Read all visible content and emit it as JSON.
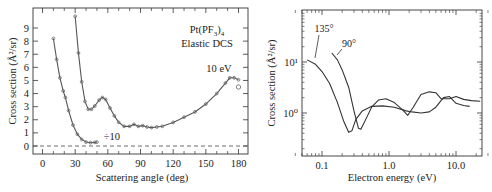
{
  "chart_data": [
    {
      "type": "line",
      "title": "Pt(PF3)4 Elastic DCS",
      "annotation_energy": "10 eV",
      "annotation_scale": "÷10",
      "xlabel": "Scattering angle (deg)",
      "ylabel": "Cross section (Å²/sr)",
      "xlim": [
        -8,
        185
      ],
      "ylim": [
        -0.5,
        10
      ],
      "xticks": [
        "0",
        "30",
        "60",
        "90",
        "120",
        "150",
        "180"
      ],
      "yticks": [
        "0",
        "1",
        "2",
        "3",
        "4",
        "5",
        "6",
        "7",
        "8",
        "9"
      ],
      "zero_line": "dashed",
      "series": [
        {
          "name": "÷10 (scaled)",
          "x": [
            10,
            13,
            16,
            19,
            21,
            24,
            28,
            32,
            36,
            40,
            44,
            48,
            50
          ],
          "y": [
            8.2,
            6.6,
            5.2,
            4.2,
            3.7,
            2.7,
            1.6,
            0.9,
            0.5,
            0.3,
            0.25,
            0.28,
            0.3
          ]
        },
        {
          "name": "10 eV",
          "x": [
            30,
            33,
            36,
            39,
            42,
            45,
            48,
            52,
            55,
            58,
            62,
            66,
            70,
            75,
            80,
            84,
            88,
            92,
            96,
            100,
            105,
            110,
            120,
            130,
            140,
            150,
            160,
            168,
            172,
            176,
            180
          ],
          "y": [
            9.9,
            7.1,
            4.9,
            3.4,
            2.8,
            2.8,
            3.05,
            3.5,
            3.7,
            3.55,
            2.9,
            2.3,
            1.8,
            1.5,
            1.5,
            1.65,
            1.5,
            1.55,
            1.45,
            1.4,
            1.45,
            1.5,
            1.8,
            2.2,
            2.6,
            3.2,
            4.0,
            4.8,
            5.2,
            5.2,
            5.05
          ]
        },
        {
          "name": "10 eV isolated point",
          "x": [
            180
          ],
          "y": [
            4.5
          ]
        }
      ]
    },
    {
      "type": "line",
      "xscale": "log",
      "yscale": "log",
      "xlabel": "Electron energy (eV)",
      "ylabel": "Cross section (Å²/sr)",
      "xticks": [
        "0.1",
        "1.0",
        "10.0"
      ],
      "yticks": [
        "10⁰",
        "10¹"
      ],
      "xlim": [
        0.035,
        35
      ],
      "ylim": [
        0.3,
        80
      ],
      "series": [
        {
          "name": "135°",
          "x": [
            0.06,
            0.08,
            0.1,
            0.13,
            0.17,
            0.21,
            0.25,
            0.28,
            0.32,
            0.4,
            0.55,
            0.8,
            1.2,
            1.8,
            2.2,
            3,
            4,
            5,
            6.5,
            8,
            10,
            13,
            16
          ],
          "y": [
            11,
            9,
            6.5,
            3.8,
            1.6,
            0.7,
            0.42,
            0.45,
            0.75,
            1.1,
            1.35,
            1.38,
            1.3,
            1.1,
            1.05,
            1.0,
            1.05,
            1.3,
            2.0,
            2.1,
            1.55,
            1.4,
            1.35
          ]
        },
        {
          "name": "90°",
          "x": [
            0.14,
            0.17,
            0.2,
            0.25,
            0.3,
            0.35,
            0.38,
            0.45,
            0.55,
            0.7,
            0.9,
            1.2,
            1.6,
            1.9,
            2.3,
            3,
            4,
            5,
            6,
            8,
            10,
            13,
            17,
            23
          ],
          "y": [
            15,
            11,
            7,
            3.2,
            1.1,
            0.5,
            0.48,
            0.75,
            1.3,
            1.8,
            1.9,
            1.6,
            1.15,
            0.9,
            1.3,
            2.3,
            2.6,
            2.5,
            1.9,
            1.9,
            2.1,
            1.85,
            1.75,
            1.7
          ]
        }
      ],
      "annotations": [
        {
          "text": "135°",
          "arrow_to": [
            0.06,
            11
          ]
        },
        {
          "text": "90°",
          "arrow_to": [
            0.14,
            15
          ]
        }
      ]
    }
  ],
  "left": {
    "title_line1": "Pt(PF",
    "title_sub1": "3",
    "title_close": ")",
    "title_sub2": "4",
    "title_line2": "Elastic DCS",
    "energy_label": "10 eV",
    "scale_label": "÷10",
    "xlabel": "Scattering angle (deg)",
    "ylabel": "Cross section (Å²/sr)"
  },
  "right": {
    "label_135": "135°",
    "label_90": "90°",
    "xlabel": "Electron energy (eV)",
    "ylabel": "Cross section (Å²/sr)"
  }
}
